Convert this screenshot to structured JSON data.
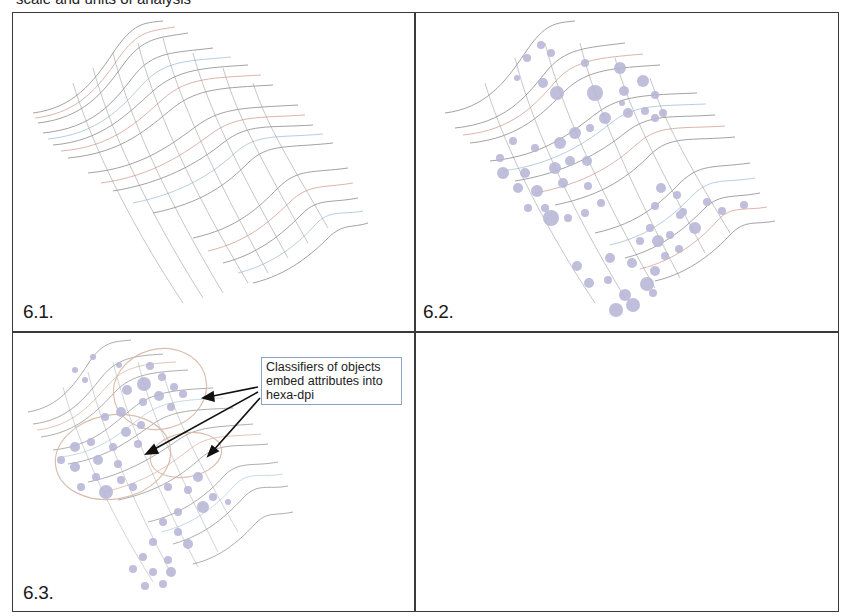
{
  "header": {
    "caption": "scale and units of analysis"
  },
  "panels": [
    {
      "id": "6.1",
      "label": "6.1.",
      "content": "wireframe-surface"
    },
    {
      "id": "6.2",
      "label": "6.2.",
      "content": "wireframe-surface-with-objects"
    },
    {
      "id": "6.3",
      "label": "6.3.",
      "content": "wireframe-surface-with-classifiers"
    },
    {
      "id": "empty",
      "label": "",
      "content": "empty"
    }
  ],
  "callout": {
    "lines": [
      "Classifiers of objects",
      "embed attributes into",
      "hexa-dpi"
    ],
    "text": "Classifiers of objects embed attributes into hexa-dpi",
    "arrow_count": 3
  },
  "colors": {
    "border": "#3a3a3a",
    "mesh_dark": "#7a7a7a",
    "mesh_red": "#c98b7a",
    "mesh_blue": "#8fb4d0",
    "dot": "#b9b7d8",
    "ellipse": "#d8b8a8",
    "callout_border": "#8ea2c2"
  }
}
